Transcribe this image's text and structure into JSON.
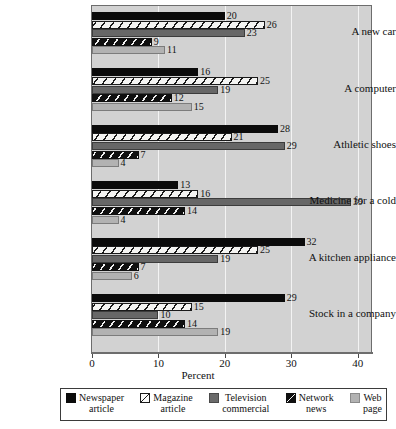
{
  "chart_data": {
    "type": "bar",
    "orientation": "horizontal",
    "title": "",
    "xlabel": "Percent",
    "ylabel": "",
    "xlim": [
      0,
      42
    ],
    "xticks": [
      0,
      10,
      20,
      30,
      40
    ],
    "xtick_labels": [
      "0",
      "10",
      "20",
      "30",
      "40"
    ],
    "grid": true,
    "grid_axis": "x",
    "legend_position": "bottom",
    "categories": [
      "A new car",
      "A computer",
      "Athletic shoes",
      "Medicine for a cold",
      "A kitchen appliance",
      "Stock in a company"
    ],
    "series": [
      {
        "name": "Newspaper article",
        "name_line1": "Newspaper",
        "name_line2": "article",
        "fill": "solid-black",
        "color": "#0b0b0b",
        "values": [
          20,
          16,
          28,
          13,
          32,
          29
        ]
      },
      {
        "name": "Magazine article",
        "name_line1": "Magazine",
        "name_line2": "article",
        "fill": "white-diagonal-hatch",
        "color": "#f4f4f2",
        "values": [
          26,
          25,
          21,
          16,
          25,
          15
        ]
      },
      {
        "name": "Television commercial",
        "name_line1": "Television",
        "name_line2": "commercial",
        "fill": "solid-dark-gray",
        "color": "#676767",
        "values": [
          23,
          19,
          29,
          39,
          19,
          10
        ]
      },
      {
        "name": "Network news",
        "name_line1": "Network",
        "name_line2": "news",
        "fill": "black-diagonal-hatch",
        "color": "#101010",
        "values": [
          9,
          12,
          7,
          14,
          7,
          14
        ]
      },
      {
        "name": "Web page",
        "name_line1": "Web",
        "name_line2": "page",
        "fill": "solid-light-gray",
        "color": "#b2b2b2",
        "values": [
          11,
          15,
          4,
          4,
          6,
          19
        ]
      }
    ]
  },
  "colors": {
    "plot_background": "#d2d2d2",
    "page_background": "#ffffff",
    "axis": "#6d6d6d",
    "gridline": "#ffffff",
    "text": "#111111"
  }
}
